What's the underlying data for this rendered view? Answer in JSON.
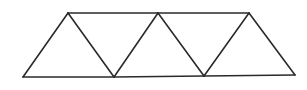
{
  "diagram": {
    "type": "geometric-figure",
    "colors": {
      "stroke": "#2a2a2a",
      "background": "#ffffff"
    },
    "vertices": {
      "A": [
        23,
        77
      ],
      "B": [
        114,
        77
      ],
      "C": [
        204,
        76
      ],
      "D": [
        295,
        75
      ],
      "E": [
        68,
        13
      ],
      "F": [
        158,
        13
      ],
      "G": [
        249,
        13
      ]
    },
    "edges": [
      [
        "A",
        "B"
      ],
      [
        "B",
        "C"
      ],
      [
        "C",
        "D"
      ],
      [
        "E",
        "F"
      ],
      [
        "F",
        "G"
      ],
      [
        "A",
        "E"
      ],
      [
        "E",
        "B"
      ],
      [
        "B",
        "F"
      ],
      [
        "F",
        "C"
      ],
      [
        "C",
        "G"
      ],
      [
        "G",
        "D"
      ]
    ],
    "triangles": [
      [
        "A",
        "E",
        "B"
      ],
      [
        "E",
        "B",
        "F"
      ],
      [
        "B",
        "F",
        "C"
      ],
      [
        "F",
        "C",
        "G"
      ],
      [
        "C",
        "G",
        "D"
      ]
    ]
  }
}
